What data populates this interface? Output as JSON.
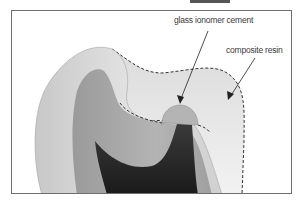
{
  "figure": {
    "labels": {
      "glass_ionomer": "glass ionomer cement",
      "composite": "composite resin"
    },
    "colors": {
      "frame": "#6e6e6e",
      "enamel": "#d6d6d6",
      "dentin": "#a9a9a9",
      "pulp": "#262626",
      "composite": "#e4e4e4",
      "glass_ionomer": "#b4b4b4",
      "dash": "#333333"
    }
  }
}
